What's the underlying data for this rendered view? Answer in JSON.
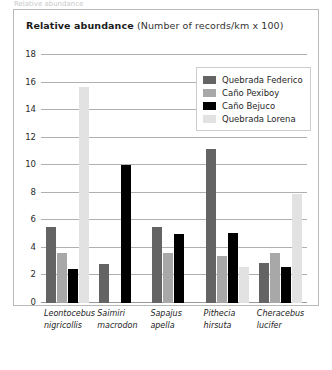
{
  "clipped_text_above": "Relative abundance",
  "title": {
    "bold": "Relative abundance",
    "regular": "(Number of records/km x 100)"
  },
  "legend": {
    "entries": [
      {
        "label": "Quebrada Federico",
        "color": "#646464"
      },
      {
        "label": "Caño Pexiboy",
        "color": "#a8a8a8"
      },
      {
        "label": "Caño Bejuco",
        "color": "#000000"
      },
      {
        "label": "Quebrada Lorena",
        "color": "#e2e2e2"
      }
    ]
  },
  "chart_data": {
    "type": "bar",
    "title": "Relative abundance (Number of records/km x 100)",
    "xlabel": "",
    "ylabel": "",
    "ylim": [
      0,
      18
    ],
    "yticks": [
      0,
      2,
      4,
      6,
      8,
      10,
      12,
      14,
      16,
      18
    ],
    "grid": true,
    "legend_position": "top-right",
    "categories": [
      "Leontocebus nigricollis",
      "Saimiri macrodon",
      "Sapajus apella",
      "Pithecia hirsuta",
      "Cheracebus lucifer"
    ],
    "category_lines": [
      [
        "Leontocebus",
        "nigricollis"
      ],
      [
        "Saimiri",
        "macrodon"
      ],
      [
        "Sapajus",
        "apella"
      ],
      [
        "Pithecia",
        "hirsuta"
      ],
      [
        "Cheracebus",
        "lucifer"
      ]
    ],
    "series": [
      {
        "name": "Quebrada Federico",
        "color": "#646464",
        "values": [
          5.5,
          2.8,
          5.5,
          11.2,
          2.9
        ]
      },
      {
        "name": "Caño Pexiboy",
        "color": "#a8a8a8",
        "values": [
          3.6,
          0,
          3.6,
          3.4,
          3.6
        ]
      },
      {
        "name": "Caño Bejuco",
        "color": "#000000",
        "values": [
          2.5,
          10.0,
          5.0,
          5.1,
          2.6
        ]
      },
      {
        "name": "Quebrada Lorena",
        "color": "#e2e2e2",
        "values": [
          15.7,
          0,
          0,
          2.6,
          7.9
        ]
      }
    ]
  }
}
